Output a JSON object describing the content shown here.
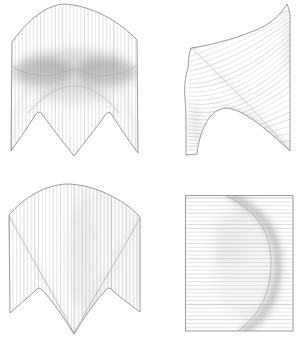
{
  "canvas": {
    "width": 298,
    "height": 345,
    "background": "#ffffff"
  },
  "colors": {
    "outline": "#8f8f8f",
    "ruling": "#cccccc",
    "ruling_dark": "#b9b9b9",
    "crease": "#adadad",
    "crease_light": "#bdbdbd",
    "shade": "#8e8e8e"
  },
  "blurs": {
    "soft": 2,
    "medium": 3.5,
    "wide": 6.5
  },
  "panels": [
    {
      "id": "front-view-shaded",
      "outline": "M 12,42 C 28,20 45,6 63,4 C 92,5 120,22 137,40 L 138,153 C 128,140 118,124 112,115 Q 109,110 106,114 C 97,127 84,143 74,156 C 64,143 51,127 42,114 Q 39,110 36,114 C 30,124 20,138 11,151 Z",
      "rulings": {
        "type": "vertical",
        "x0": 11.5,
        "x1": 138.5,
        "step": 3.65,
        "y0": 0,
        "y1": 160
      },
      "creases": [
        {
          "d": "M 12,66 C 26,76 46,77 58,74 C 65,72 70,69 74,69 C 78,69 83,72 90,74 C 102,77 122,76 136,66",
          "width": 0.7,
          "tone": "crease"
        },
        {
          "d": "M 28,113 C 46,93 59,86 74,86 C 89,86 102,93 119,113",
          "width": 0.7,
          "tone": "crease_light"
        }
      ],
      "shades": [
        {
          "kind": "ellipse",
          "cx": 43,
          "cy": 72,
          "rx": 30,
          "ry": 14,
          "opacity": 0.38,
          "blur": "medium"
        },
        {
          "kind": "ellipse",
          "cx": 106,
          "cy": 72,
          "rx": 30,
          "ry": 14,
          "opacity": 0.38,
          "blur": "medium"
        },
        {
          "kind": "ellipse",
          "cx": 74,
          "cy": 63,
          "rx": 50,
          "ry": 13,
          "opacity": 0.25,
          "blur": "wide"
        },
        {
          "kind": "ellipse",
          "cx": 74,
          "cy": 75,
          "rx": 64,
          "ry": 22,
          "opacity": 0.1,
          "blur": "wide"
        },
        {
          "kind": "ellipse",
          "cx": 74,
          "cy": 92,
          "rx": 34,
          "ry": 12,
          "opacity": 0.14,
          "blur": "wide"
        },
        {
          "kind": "stroke",
          "d": "M 28,113 C 46,93 59,86 74,86 C 89,86 102,93 119,113",
          "width": 4,
          "opacity": 0.16,
          "blur": "medium"
        },
        {
          "kind": "stroke",
          "d": "M 26,88 C 18,108 14,128 11,148",
          "width": 5,
          "opacity": 0.13,
          "blur": "medium"
        },
        {
          "kind": "stroke",
          "d": "M 122,88 C 130,108 134,128 138,150",
          "width": 5,
          "opacity": 0.13,
          "blur": "medium"
        }
      ]
    },
    {
      "id": "side-view",
      "outline": "M 287,4 C 282,12 275,20 263,27 C 243,36 214,45 191,48 C 188,56 189,62 188,68 C 185,78 184,88 185,98 C 186,108 186,118 186,128 L 186,155 L 197,154 C 199,134 208,109 226,108 C 244,109 267,130 290,151 L 290,16 C 290,11 288,7 287,4 Z",
      "rulings": {
        "type": "fan",
        "count": 26,
        "s0": [
          191,
          50
        ],
        "s1": [
          187,
          150
        ],
        "e0": [
          289,
          10
        ],
        "e1": [
          290,
          148
        ],
        "sExp": 0.85,
        "eExp": 1.35,
        "sag": 20
      },
      "creases": [
        {
          "d": "M 194,50 C 231,86 262,118 289,150",
          "width": 0.6,
          "tone": "crease_light"
        }
      ],
      "shades": [
        {
          "kind": "stroke",
          "d": "M 226,108 C 245,109 268,131 290,151",
          "width": 4,
          "opacity": 0.22,
          "blur": "soft"
        },
        {
          "kind": "stroke",
          "d": "M 195,51 C 233,87 264,119 289,149",
          "width": 4,
          "opacity": 0.12,
          "blur": "medium"
        },
        {
          "kind": "ellipse",
          "cx": 287,
          "cy": 45,
          "rx": 4,
          "ry": 30,
          "opacity": 0.15,
          "blur": "medium"
        },
        {
          "kind": "ellipse",
          "cx": 196,
          "cy": 125,
          "rx": 6,
          "ry": 22,
          "opacity": 0.12,
          "blur": "medium"
        }
      ]
    },
    {
      "id": "front-view-creased",
      "outline": "M 9,215 C 24,197 46,185 66,184 C 94,184 125,200 140,217 L 140,312 C 128,303 117,295 112,290 Q 109,286 106,290 C 96,300 84,318 74,334 C 64,318 52,300 42,290 Q 39,286 36,290 C 31,295 20,304 10,313 Z",
      "rulings": {
        "type": "vertical",
        "x0": 9.3,
        "x1": 140,
        "step": 3.65,
        "y0": 180,
        "y1": 340
      },
      "creases": [
        {
          "d": "M 9,216 C 32,258 56,300 74,333",
          "width": 0.7,
          "tone": "crease"
        },
        {
          "d": "M 140,218 C 117,260 92,300 74,333",
          "width": 0.7,
          "tone": "crease"
        },
        {
          "d": "M 74,186 L 74,333",
          "width": 0.6,
          "tone": "crease_light"
        }
      ],
      "shades": [
        {
          "kind": "ellipse",
          "cx": 108,
          "cy": 255,
          "rx": 40,
          "ry": 75,
          "opacity": 0.07,
          "blur": "wide"
        },
        {
          "kind": "ellipse",
          "cx": 82,
          "cy": 250,
          "rx": 12,
          "ry": 70,
          "opacity": 0.05,
          "blur": "wide"
        },
        {
          "kind": "stroke",
          "d": "M 9,216 C 32,258 56,300 74,333",
          "width": 3,
          "opacity": 0.1,
          "blur": "medium"
        },
        {
          "kind": "stroke",
          "d": "M 140,218 C 117,260 92,300 74,333",
          "width": 3,
          "opacity": 0.1,
          "blur": "medium"
        }
      ]
    },
    {
      "id": "top-view",
      "outline": "M 185.5,195.5 L 293,195.5 L 293,331 L 185.5,331 Z",
      "rulings": {
        "type": "horizontal",
        "y0": 198,
        "y1": 329.5,
        "step": 3.8,
        "x0": 185.8,
        "x1": 292.7
      },
      "creases": [
        {
          "d": "M 227,196 C 262,214 271,237 271,263 C 271,291 261,314 238,331",
          "width": 0.8,
          "tone": "crease"
        }
      ],
      "shades": [
        {
          "kind": "stroke",
          "d": "M 232,196 C 269,216 278,239 278,264 C 278,291 268,315 245,331",
          "width": 7,
          "opacity": 0.3,
          "blur": "soft"
        },
        {
          "kind": "stroke",
          "d": "M 232,196 C 269,216 278,239 278,264 C 278,291 268,315 245,331",
          "width": 14,
          "opacity": 0.13,
          "blur": "medium"
        },
        {
          "kind": "ellipse",
          "cx": 246,
          "cy": 264,
          "rx": 32,
          "ry": 60,
          "opacity": 0.08,
          "blur": "wide"
        },
        {
          "kind": "ellipse",
          "cx": 228,
          "cy": 240,
          "rx": 18,
          "ry": 30,
          "opacity": 0.06,
          "blur": "wide"
        }
      ]
    }
  ]
}
